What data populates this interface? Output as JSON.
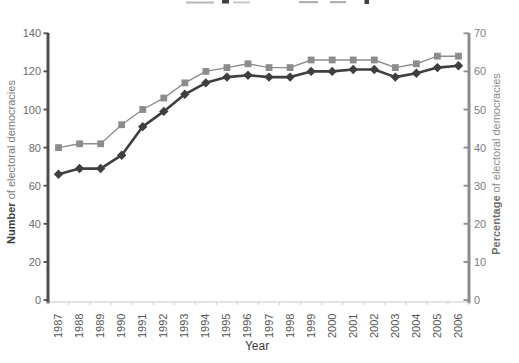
{
  "chart_data": {
    "type": "line",
    "title": "",
    "title_note": "title clipped off top edge of screenshot",
    "x_label": "Year",
    "x_categories": [
      "1987",
      "1988",
      "1989",
      "1990",
      "1991",
      "1992",
      "1993",
      "1994",
      "1995",
      "1996",
      "1997",
      "1998",
      "1999",
      "2000",
      "2001",
      "2002",
      "2003",
      "2004",
      "2005",
      "2006"
    ],
    "left_axis": {
      "label_bold": "Number",
      "label_rest": " of electoral democracies",
      "min": 0,
      "max": 140,
      "tick_step": 20,
      "ticks": [
        0,
        20,
        40,
        60,
        80,
        100,
        120,
        140
      ]
    },
    "right_axis": {
      "label_bold": "Percentage",
      "label_rest": " of electoral democracies",
      "min": 0,
      "max": 70,
      "tick_step": 10,
      "ticks": [
        0,
        10,
        20,
        30,
        40,
        50,
        60,
        70
      ]
    },
    "series": [
      {
        "name": "Number of electoral democracies",
        "axis": "left",
        "marker": "diamond",
        "color": "#3f3f3f",
        "values": [
          66,
          69,
          69,
          76,
          91,
          99,
          108,
          114,
          117,
          118,
          117,
          117,
          120,
          120,
          121,
          121,
          117,
          119,
          122,
          123
        ]
      },
      {
        "name": "Percentage of electoral democracies",
        "axis": "right",
        "marker": "square",
        "color": "#8c8c8c",
        "values": [
          40,
          41,
          41,
          46,
          50,
          53,
          57,
          60,
          61,
          62,
          61,
          61,
          63,
          63,
          63,
          63,
          61,
          62,
          64,
          64
        ]
      }
    ],
    "legend": "none",
    "grid": "off"
  },
  "colors": {
    "number_series": "#3f3f3f",
    "percentage_series": "#8c8c8c",
    "left_axis": "#4d4d4d",
    "right_axis": "#8c8c8c",
    "left_tick_label": "#6b6b6b",
    "right_tick_label": "#7d7d7d",
    "year_label": "#565656",
    "baseline": "#c8c8c8",
    "x_minor_tick": "#cfcfcf"
  }
}
